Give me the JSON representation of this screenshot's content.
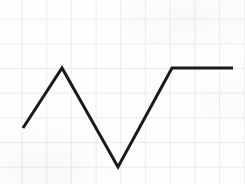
{
  "figure": {
    "background_color": "#fefefe",
    "width": 245,
    "height": 184,
    "caption": ""
  },
  "grid": {
    "visible": true,
    "color": "#e3e3e6",
    "stroke_width": 0.8,
    "spacing_px": 24.7,
    "x_origin_px": 22,
    "y_origin_px": 19,
    "vertical_lines_px": [
      22,
      46.7,
      71.4,
      96.1,
      120.8,
      145.5,
      170.2,
      194.9,
      219.6,
      244.3
    ],
    "horizontal_lines_px": [
      19,
      43.7,
      68.4,
      93.1,
      117.8,
      142.5,
      167.2,
      180
    ]
  },
  "series": {
    "name": "zigzag-line",
    "color": "#1a1a1a",
    "stroke_width": 3.0,
    "line_cap": "butt",
    "line_join": "miter",
    "points_px": [
      {
        "x": 23,
        "y": 128
      },
      {
        "x": 62,
        "y": 68
      },
      {
        "x": 118,
        "y": 167
      },
      {
        "x": 172,
        "y": 68
      },
      {
        "x": 233,
        "y": 68
      }
    ],
    "polyline_attr": "23,128 62,68 118,167 172,68 233,68"
  },
  "chart_data": {
    "type": "line",
    "title": "",
    "subtitle": "",
    "xlabel": "",
    "ylabel": "",
    "grid": true,
    "legend": "none",
    "x": [
      0.04,
      1.62,
      3.89,
      6.08,
      8.55
    ],
    "y": [
      2.2,
      4.6,
      0.6,
      4.6,
      4.6
    ],
    "series": [
      {
        "name": "zigzag-line",
        "color": "#1a1a1a",
        "x": [
          0.04,
          1.62,
          3.89,
          6.08,
          8.55
        ],
        "y": [
          2.2,
          4.6,
          0.6,
          4.6,
          4.6
        ]
      }
    ],
    "xlim": [
      0,
      9
    ],
    "ylim": [
      0,
      6.5
    ],
    "xticklabels": [],
    "yticklabels": [],
    "annotations": []
  }
}
